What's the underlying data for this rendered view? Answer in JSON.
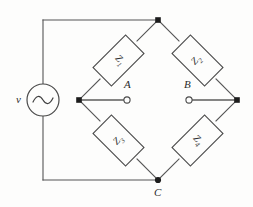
{
  "figure": {
    "kind": "ac-bridge-circuit-diagram",
    "background_color": "#fdfdfc",
    "line_color": "#4a4a4a",
    "node_color": "#1a1a1a"
  },
  "source": {
    "label": "v",
    "symbol": "ac-source-sine",
    "center": [
      43,
      100
    ],
    "radius": 16
  },
  "impedances": [
    {
      "id": "Z1",
      "label": "Z",
      "subscript": "1",
      "position": "upper-left-arm",
      "center": [
        120,
        60
      ],
      "orientation": "rot-down"
    },
    {
      "id": "Z2",
      "label": "Z",
      "subscript": "2",
      "position": "upper-right-arm",
      "center": [
        196,
        60
      ],
      "orientation": "rot-up"
    },
    {
      "id": "Z3",
      "label": "Z",
      "subscript": "3",
      "position": "lower-left-arm",
      "center": [
        120,
        141
      ],
      "orientation": "rot-up"
    },
    {
      "id": "Z4",
      "label": "Z",
      "subscript": "4",
      "position": "lower-right-arm",
      "center": [
        196,
        141
      ],
      "orientation": "rot-down"
    }
  ],
  "nodes": [
    {
      "id": "top",
      "label": "",
      "x": 158,
      "y": 20,
      "type": "filled"
    },
    {
      "id": "left",
      "label": "",
      "x": 79,
      "y": 100,
      "type": "filled"
    },
    {
      "id": "right",
      "label": "",
      "x": 237,
      "y": 100,
      "type": "filled"
    },
    {
      "id": "bottom",
      "label": "C",
      "x": 158,
      "y": 180,
      "type": "filled"
    }
  ],
  "terminals": [
    {
      "id": "A",
      "label": "A",
      "x": 128,
      "y": 100,
      "type": "open",
      "label_x": 125,
      "label_y": 84
    },
    {
      "id": "B",
      "label": "B",
      "x": 188,
      "y": 100,
      "type": "open",
      "label_x": 185,
      "label_y": 84
    }
  ],
  "node_labels": {
    "c": "C",
    "a": "A",
    "b": "B",
    "source": "v"
  }
}
